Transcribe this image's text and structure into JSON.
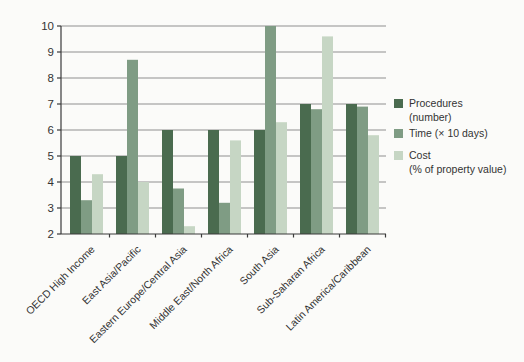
{
  "chart_data": {
    "type": "bar",
    "title": "",
    "categories": [
      "OECD High Income",
      "East Asia/Pacific",
      "Eastern Europe/Central Asia",
      "Middle East/North Africa",
      "South Asia",
      "Sub-Saharan Africa",
      "Latin America/Caribbean"
    ],
    "series": [
      {
        "name": "Procedures (number)",
        "label_lines": [
          "Procedures",
          "(number)"
        ],
        "color": "#4a6b4f",
        "values": [
          5,
          5,
          6,
          6,
          6,
          7,
          7
        ]
      },
      {
        "name": "Time (× 10 days)",
        "label_lines": [
          "Time (× 10 days)"
        ],
        "color": "#7f9c84",
        "values": [
          3.3,
          8.7,
          3.75,
          3.2,
          10,
          6.8,
          6.9
        ]
      },
      {
        "name": "Cost (% of property value)",
        "label_lines": [
          "Cost",
          "(% of property value)"
        ],
        "color": "#c6d6c4",
        "values": [
          4.3,
          4.0,
          2.3,
          5.6,
          6.3,
          9.6,
          5.8
        ]
      }
    ],
    "ylim": [
      2,
      10
    ],
    "ytick_step": 1,
    "yticks": [
      2,
      3,
      4,
      5,
      6,
      7,
      8,
      9,
      10
    ],
    "grid": true,
    "legend_position": "right",
    "xlabel": "",
    "ylabel": ""
  },
  "colors": {
    "background": "#fbfbf9",
    "grid": "#8f8f8f",
    "axis": "#3a3a3a",
    "text": "#333333"
  }
}
